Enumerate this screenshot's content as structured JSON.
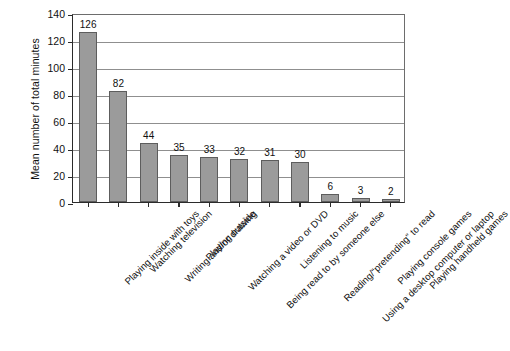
{
  "chart_data": {
    "type": "bar",
    "title": "",
    "xlabel": "",
    "ylabel": "Mean number of total minutes",
    "ylim": [
      0,
      140
    ],
    "ytick_step": 20,
    "yticks": [
      0,
      20,
      40,
      60,
      80,
      100,
      120,
      140
    ],
    "grid": true,
    "legend": false,
    "bar_color": "#9b9b9b",
    "bar_edge_color": "#5d5d5d",
    "categories": [
      "Playing inside with toys",
      "Watching television",
      "Writing and/or drawing",
      "Playing outside",
      "Watching a video or DVD",
      "Being read to by someone else",
      "Listening to music",
      "Reading/“pretending” to read",
      "Using a desktop computer or laptop",
      "Playing console games",
      "Playing handheld games"
    ],
    "values": [
      126,
      82,
      44,
      35,
      33,
      32,
      31,
      30,
      6,
      3,
      2
    ],
    "value_labels": [
      "126",
      "82",
      "44",
      "35",
      "33",
      "32",
      "31",
      "30",
      "6",
      "3",
      "2"
    ]
  }
}
